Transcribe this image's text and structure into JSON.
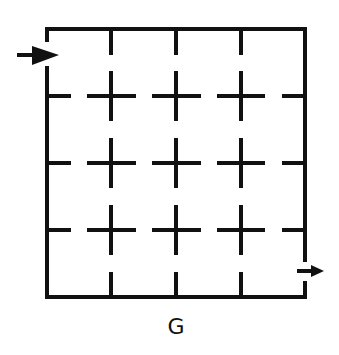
{
  "figure": {
    "label": "G",
    "type": "maze",
    "grid": {
      "rows": 4,
      "cols": 4
    },
    "colors": {
      "stroke": "#111111",
      "background": "#ffffff"
    },
    "entry": {
      "side": "left",
      "row": 1,
      "marker": "arrow-right-icon"
    },
    "exit": {
      "side": "right",
      "row": 4,
      "marker": "arrow-right-icon"
    },
    "interior": "broken grid lines forming plus-shaped crosses at every interior intersection, with short ticks along each wall"
  }
}
